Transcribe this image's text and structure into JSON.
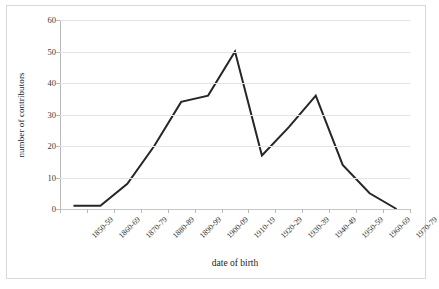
{
  "chart_data": {
    "type": "line",
    "title": "",
    "xlabel": "date of birth",
    "ylabel": "number of contributors",
    "categories": [
      "1850-59",
      "1860-69",
      "1870-79",
      "1880-89",
      "1890-99",
      "1900-09",
      "1910-19",
      "1920-29",
      "1930-39",
      "1940-49",
      "1950-59",
      "1960-69",
      "1970-79"
    ],
    "values": [
      1,
      1,
      8,
      20,
      34,
      36,
      50,
      17,
      26,
      36,
      14,
      5,
      0
    ],
    "series": [
      {
        "name": "number of contributors",
        "values": [
          1,
          1,
          8,
          20,
          34,
          36,
          50,
          17,
          26,
          36,
          14,
          5,
          0
        ]
      }
    ],
    "ylim": [
      0,
      60
    ],
    "yticks": [
      0,
      10,
      20,
      30,
      40,
      50,
      60
    ],
    "ytick_labels": [
      "0",
      "10",
      "20",
      "30",
      "40",
      "50",
      "60"
    ],
    "grid": "horizontal",
    "legend": "none",
    "line_color": "#262626",
    "grid_color": "#e4e4e4",
    "axis_color": "#b9b9b9",
    "background": "#ffffff"
  }
}
